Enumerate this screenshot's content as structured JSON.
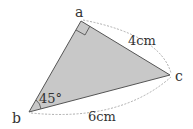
{
  "diagram": {
    "type": "triangle",
    "vertices": {
      "a": {
        "label": "a",
        "x": 81,
        "y": 21
      },
      "b": {
        "label": "b",
        "x": 29,
        "y": 112
      },
      "c": {
        "label": "c",
        "x": 170,
        "y": 75
      }
    },
    "angle_b": "45°",
    "right_angle_at": "a",
    "side_ac": "4cm",
    "side_bc": "6cm",
    "fill_color": "#c8c8c8",
    "stroke_color": "#555555"
  }
}
